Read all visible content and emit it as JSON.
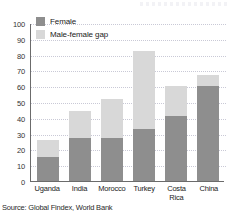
{
  "chart_data": {
    "type": "bar",
    "subtype": "stacked-bar",
    "title": "",
    "xlabel": "",
    "ylabel": "",
    "ylim": [
      0,
      100
    ],
    "ytick_step": 10,
    "yticks": [
      0,
      10,
      20,
      30,
      40,
      50,
      60,
      70,
      80,
      90,
      100
    ],
    "ytick_labels": [
      "0",
      "10",
      "20",
      "30",
      "40",
      "50",
      "60",
      "70",
      "80",
      "90",
      "100"
    ],
    "grid": "horizontal-dotted",
    "legend_position": "top-left-inside",
    "categories": [
      "Uganda",
      "India",
      "Morocco",
      "Turkey",
      "Costa Rica",
      "China"
    ],
    "category_labels": [
      [
        "Uganda"
      ],
      [
        "India"
      ],
      [
        "Morocco"
      ],
      [
        "Turkey"
      ],
      [
        "Costa",
        "Rica"
      ],
      [
        "China"
      ]
    ],
    "series": [
      {
        "name": "Female",
        "color": "#8e8e8e",
        "values": [
          15,
          27,
          27,
          33,
          41,
          60
        ]
      },
      {
        "name": "Male-female gap",
        "color": "#d8d8d8",
        "values": [
          11,
          17,
          25,
          49,
          19,
          7
        ]
      }
    ],
    "totals": [
      26,
      44,
      52,
      82,
      60,
      67
    ],
    "annotations": []
  },
  "legend": {
    "items": [
      {
        "label": "Female",
        "color": "#8e8e8e"
      },
      {
        "label": "Male-female gap",
        "color": "#d8d8d8"
      }
    ]
  },
  "source": {
    "text": "Source: Global Findex, World Bank"
  },
  "colors": {
    "female": "#8e8e8e",
    "gap": "#d8d8d8",
    "axis": "#6b6b6b",
    "gridline": "#c9c9d6",
    "background": "#ffffff"
  }
}
